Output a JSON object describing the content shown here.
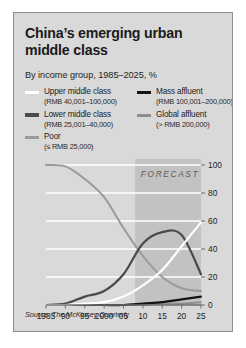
{
  "panel": {
    "title": "China’s emerging urban middle class",
    "subtitle": "By income group, 1985–2025, %",
    "source": "Source: The McKinsey Quarterly",
    "background": "#d9d9d9",
    "border_color": "#8e8e8e"
  },
  "legend": {
    "position": "top",
    "left_column": [
      {
        "label": "Upper middle class",
        "sublabel": "(RMB 40,001–100,000)",
        "color": "#ffffff",
        "swatch": "line-swatch-upper-middle-class"
      },
      {
        "label": "Lower middle class",
        "sublabel": "(RMB 25,001–40,000)",
        "color": "#4a4a4a",
        "swatch": "line-swatch-lower-middle-class"
      },
      {
        "label": "Poor",
        "sublabel": "(≤ RMB 25,000)",
        "color": "#9a9a9a",
        "swatch": "line-swatch-poor"
      }
    ],
    "right_column": [
      {
        "label": "Mass affluent",
        "sublabel": "(RMB 100,001–200,000)",
        "color": "#141414",
        "swatch": "line-swatch-mass-affluent"
      },
      {
        "label": "Global affluent",
        "sublabel": "(> RMB 200,000)",
        "color": "#8f8f8f",
        "swatch": "line-swatch-global-affluent"
      }
    ]
  },
  "forecast": {
    "label": "FORECAST",
    "start_year": 2008,
    "end_year": 2025,
    "band_color": "#c2c2c2"
  },
  "chart_data": {
    "type": "line",
    "title": "China’s emerging urban middle class",
    "subtitle": "By income group, 1985–2025, %",
    "xlabel": "",
    "ylabel": "%",
    "xlim": [
      1985,
      2025
    ],
    "ylim": [
      0,
      100
    ],
    "yticks": [
      0,
      20,
      40,
      60,
      80,
      100
    ],
    "xticks": [
      1985,
      1990,
      1995,
      2000,
      2005,
      2010,
      2015,
      2020,
      2025
    ],
    "xtick_labels": [
      "1985",
      "90",
      "95",
      "2000",
      "05",
      "10",
      "15",
      "20",
      "25"
    ],
    "grid": "horizontal",
    "legend_position": "top",
    "x": [
      1985,
      1990,
      1995,
      2000,
      2005,
      2010,
      2015,
      2020,
      2025
    ],
    "series": [
      {
        "name": "Poor",
        "color": "#9a9a9a",
        "values": [
          100,
          99,
          90,
          77,
          55,
          35,
          20,
          12,
          10
        ]
      },
      {
        "name": "Lower middle class",
        "color": "#4a4a4a",
        "values": [
          0,
          1,
          6,
          10,
          22,
          44,
          52,
          50,
          22
        ]
      },
      {
        "name": "Upper middle class",
        "color": "#ffffff",
        "values": [
          0,
          0,
          1,
          2,
          6,
          14,
          25,
          42,
          59
        ]
      },
      {
        "name": "Mass affluent",
        "color": "#141414",
        "values": [
          0,
          0,
          0,
          0,
          0,
          1,
          2,
          4,
          6
        ]
      },
      {
        "name": "Global affluent",
        "color": "#8f8f8f",
        "values": [
          0,
          0,
          0,
          0,
          0,
          0,
          1,
          1,
          2
        ]
      }
    ]
  }
}
